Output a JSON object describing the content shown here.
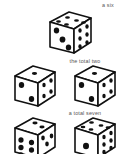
{
  "figure": {
    "background_color": "#ffffff",
    "ink_color": "#111111",
    "face_color": "#ffffff",
    "caption_color": "#565656"
  },
  "captions": {
    "six": "a six",
    "total_two": "the total two",
    "total_seven": "a total seven"
  },
  "dice": [
    {
      "group": "six",
      "name": "die-a-six",
      "front_pips": 3,
      "right_pips": 6,
      "top_pips": 5
    },
    {
      "group": "total_two",
      "name": "die-total-two-left",
      "front_pips": 2,
      "right_pips": 4,
      "top_pips": 1
    },
    {
      "group": "total_two",
      "name": "die-total-two-right",
      "front_pips": 2,
      "right_pips": 4,
      "top_pips": 1
    },
    {
      "group": "total_seven",
      "name": "die-total-seven-left",
      "front_pips": 6,
      "right_pips": 3,
      "top_pips": 2
    },
    {
      "group": "total_seven",
      "name": "die-total-seven-right",
      "front_pips": 1,
      "right_pips": 6,
      "top_pips": 5
    }
  ]
}
